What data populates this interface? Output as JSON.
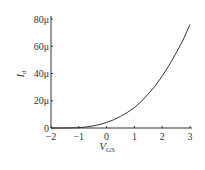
{
  "chart_data": {
    "type": "line",
    "title": "",
    "xlabel": "V",
    "xlabel_sub": "GS",
    "ylabel": "I",
    "ylabel_sub": "d",
    "xlim": [
      -2,
      3
    ],
    "ylim": [
      0,
      80
    ],
    "x_ticks": [
      "−2",
      "−1",
      "0",
      "1",
      "2",
      "3"
    ],
    "y_ticks": [
      "0",
      "20μ",
      "40μ",
      "60μ",
      "80μ"
    ],
    "grid": false,
    "legend": null,
    "series": [
      {
        "name": "Id",
        "x": [
          -2,
          -1.5,
          -1,
          -0.75,
          -0.5,
          -0.25,
          0,
          0.25,
          0.5,
          0.75,
          1,
          1.25,
          1.5,
          1.75,
          2,
          2.25,
          2.5,
          2.75,
          3
        ],
        "y": [
          0,
          0,
          0.2,
          0.7,
          1.5,
          2.6,
          4,
          6,
          8.5,
          11.5,
          15,
          19.5,
          25,
          31,
          38,
          46,
          55,
          64.5,
          76
        ],
        "color": "#333333"
      }
    ]
  }
}
